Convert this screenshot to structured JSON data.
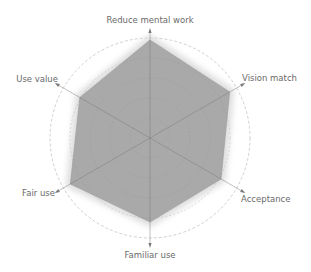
{
  "chart_data": {
    "type": "radar",
    "title": "",
    "axes": [
      "Reduce mental work",
      "Vision match",
      "Acceptance",
      "Familiar use",
      "Fair use",
      "Use value"
    ],
    "series": [
      {
        "name": "",
        "values": [
          98,
          92,
          82,
          84,
          92,
          81
        ],
        "color": "#a9a9a9"
      }
    ],
    "range": [
      0,
      100
    ],
    "grid_rings": 4,
    "outer_ring_style": "dashed",
    "legend": "none"
  },
  "colors": {
    "fill": "#a9a9a9",
    "halo": "#d8d8d8",
    "grid": "#8e8e8e",
    "axis": "#7a7a7a",
    "outer_ring": "#c4c4c4",
    "label": "#6a6a6a"
  }
}
